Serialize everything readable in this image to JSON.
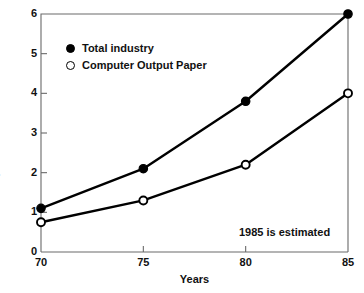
{
  "chart_data": {
    "type": "line",
    "title": "",
    "xlabel": "Years",
    "ylabel": "$ In Billions",
    "x": [
      70,
      75,
      80,
      85
    ],
    "xtick_labels": [
      "70",
      "75",
      "80",
      "85"
    ],
    "ytick_labels": [
      "0",
      "1",
      "2",
      "3",
      "4",
      "5",
      "6"
    ],
    "yticks": [
      0,
      1,
      2,
      3,
      4,
      5,
      6
    ],
    "xlim": [
      70,
      85
    ],
    "ylim": [
      0,
      6
    ],
    "grid": false,
    "legend_position": "upper-left-inside",
    "series": [
      {
        "name": "Total industry",
        "marker": "filled-circle",
        "values": [
          1.1,
          2.1,
          3.8,
          6.0
        ]
      },
      {
        "name": "Computer Output Paper",
        "marker": "open-circle",
        "values": [
          0.75,
          1.3,
          2.2,
          4.0
        ]
      }
    ],
    "annotations": [
      {
        "text": "1985 is estimated",
        "position": "bottom-right"
      }
    ],
    "colors": {
      "line": "#000000",
      "axis": "#6a6a6a",
      "text": "#111111",
      "background": "#ffffff"
    }
  }
}
